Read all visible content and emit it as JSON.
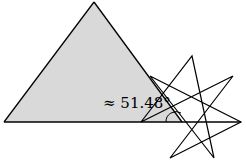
{
  "diagram": {
    "angle_label": "≈ 51.48°",
    "colors": {
      "triangle_fill": "#d9d9d9",
      "stroke": "#000000",
      "background": "#ffffff"
    },
    "triangle": {
      "points": [
        [
          4,
          122
        ],
        [
          94,
          2
        ],
        [
          182,
          122
        ]
      ]
    },
    "heptagram": {
      "type": "{7/3} star",
      "points": [
        [
          192,
          56
        ],
        [
          233,
          76
        ],
        [
          241,
          122
        ],
        [
          214,
          158
        ],
        [
          170,
          158
        ],
        [
          141,
          122
        ],
        [
          150,
          76
        ]
      ]
    },
    "angle_arc": {
      "center": [
        176,
        122
      ],
      "radius": 10
    }
  }
}
